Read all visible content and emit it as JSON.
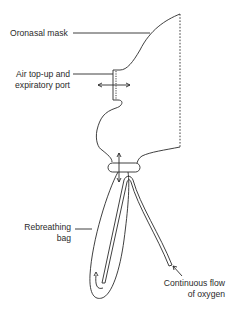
{
  "diagram": {
    "labels": {
      "mask": "Oronasal mask",
      "port_line1": "Air top-up and",
      "port_line2": "expiratory port",
      "bag_line1": "Rebreathing",
      "bag_line2": "bag",
      "oxygen_line1": "Continuous flow",
      "oxygen_line2": "of oxygen"
    },
    "colors": {
      "stroke": "#2a2a2a",
      "background": "#ffffff"
    }
  }
}
